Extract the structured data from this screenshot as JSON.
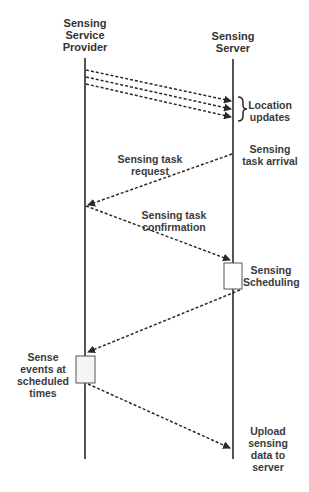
{
  "diagram": {
    "type": "sequence",
    "participants": [
      {
        "id": "provider",
        "label": "Sensing\nService\nProvider"
      },
      {
        "id": "server",
        "label": "Sensing\nServer"
      }
    ],
    "messages": [
      {
        "id": "location-updates",
        "from": "provider",
        "to": "server",
        "count": 3,
        "label": "Location\nupdates"
      },
      {
        "id": "task-request",
        "from": "server",
        "to": "provider",
        "label": "Sensing task\nrequest"
      },
      {
        "id": "task-confirmation",
        "from": "provider",
        "to": "server",
        "label": "Sensing task\nconfirmation"
      },
      {
        "id": "schedule-result",
        "from": "server",
        "to": "provider",
        "label": ""
      },
      {
        "id": "upload",
        "from": "provider",
        "to": "server",
        "label": "Upload\nsensing\ndata to\nserver"
      }
    ],
    "annotations": {
      "task_arrival": "Sensing\ntask arrival",
      "scheduling": "Sensing\nScheduling",
      "sense_events": "Sense\nevents at\nscheduled\ntimes"
    },
    "colors": {
      "line": "#2a2a2a",
      "text": "#3a3a3a",
      "box_fill": "#ffffff",
      "box_stroke": "#555555"
    }
  }
}
